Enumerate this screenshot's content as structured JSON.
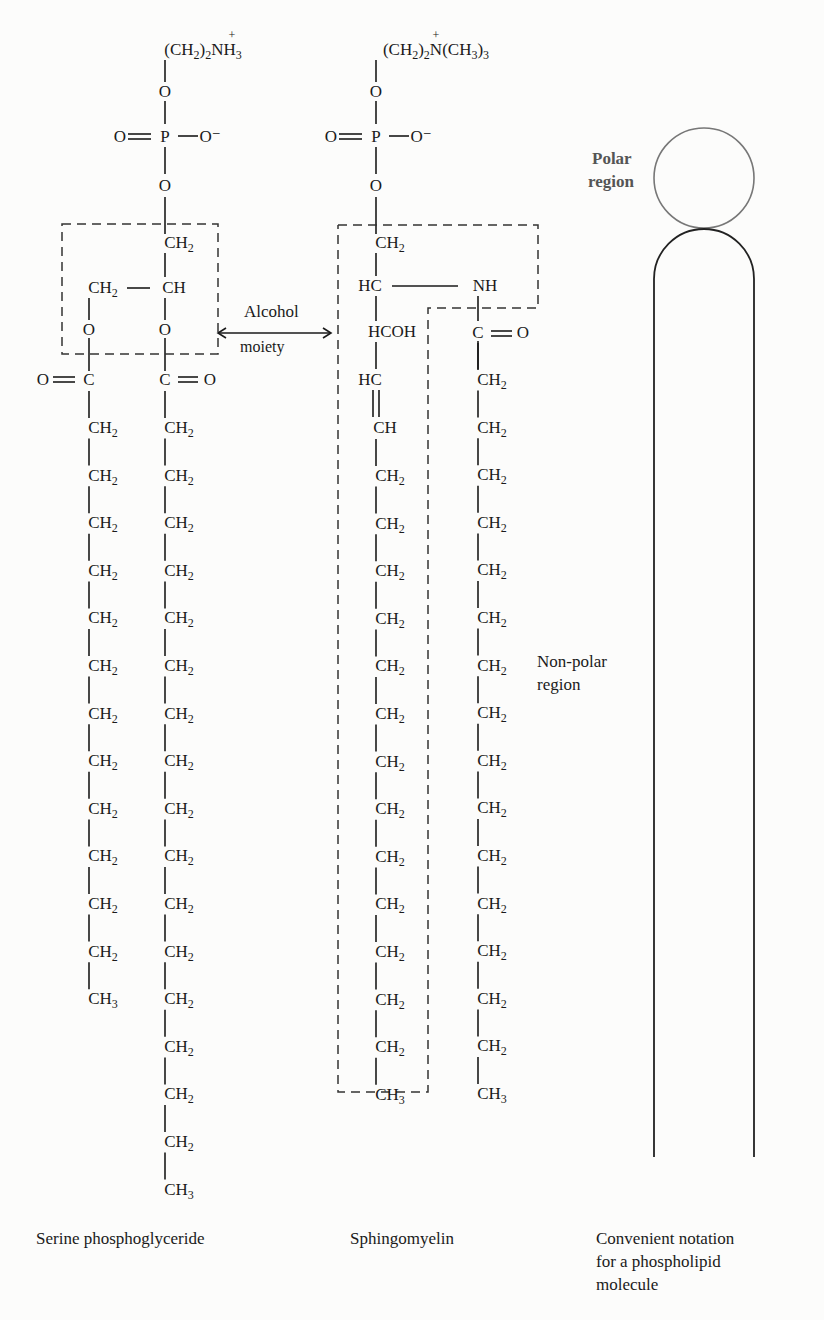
{
  "serine": {
    "head": "(CH2)2NH3",
    "head_parts": {
      "a": "(CH",
      "b": "2",
      "c": ")",
      "d": "2",
      "e": "NH",
      "f": "3"
    },
    "charge": "+",
    "o1": "O",
    "phosphate": {
      "o_double": "O",
      "p": "P",
      "o_minus": "O⁻"
    },
    "o2": "O",
    "glycerol": {
      "ch2_top": "CH",
      "ch2_left": "CH",
      "ch": "CH",
      "o_left": "O",
      "o_right": "O"
    },
    "carbonyl_left": "O═C",
    "carbonyl_right": "C═O",
    "chain_left": {
      "count_ch2": 12,
      "end": "CH3"
    },
    "chain_right": {
      "count_ch2": 16,
      "end": "CH3"
    },
    "caption": "Serine phosphoglyceride"
  },
  "sphingomyelin": {
    "head": "(CH2)2N(CH3)3",
    "charge": "+",
    "o1": "O",
    "phosphate": {
      "o_double": "O",
      "p": "P",
      "o_minus": "O⁻"
    },
    "o2": "O",
    "backbone": {
      "ch2": "CH",
      "hc": "HC",
      "nh": "NH",
      "hcoh": "HCOH",
      "hc2": "HC",
      "ch": "CH",
      "co": "C═O"
    },
    "chain_left": {
      "count_ch2": 13,
      "end": "CH3"
    },
    "chain_right": {
      "count_ch2": 15,
      "end": "CH3"
    },
    "caption": "Sphingomyelin"
  },
  "annotation": {
    "alcohol_line1": "Alcohol",
    "alcohol_line2": "moiety",
    "polar_line1": "Polar",
    "polar_line2": "region",
    "nonpolar_line1": "Non-polar",
    "nonpolar_line2": "region"
  },
  "notation": {
    "caption_line1": "Convenient notation",
    "caption_line2": "for a phospholipid",
    "caption_line3": "molecule"
  },
  "text": {
    "CH": "CH",
    "sub2": "2",
    "sub3": "3",
    "O": "O",
    "P": "P",
    "C": "C",
    "eq": "═",
    "dash": "—"
  }
}
